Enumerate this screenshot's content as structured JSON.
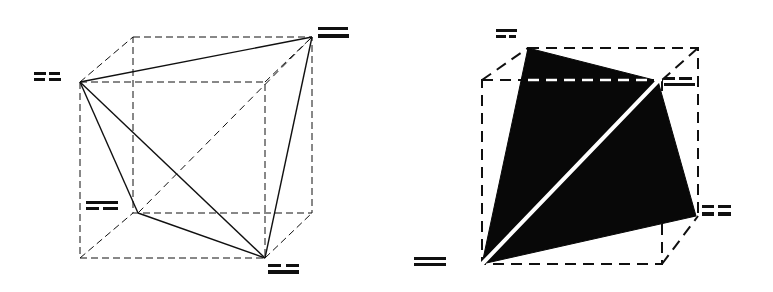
{
  "figure": {
    "canvas": {
      "width": 773,
      "height": 292,
      "background": "#ffffff"
    },
    "ink_color": "#101010",
    "highlight_color": "#ffffff",
    "panels": [
      {
        "id": "left-panel",
        "name": "wireframe-tetrahedron-in-cube",
        "style": "outline",
        "cube": {
          "stroke": "#101010",
          "stroke_width": 1,
          "dash": "7,4",
          "front_face": [
            [
              80,
              82
            ],
            [
              265,
              82
            ],
            [
              265,
              258
            ],
            [
              80,
              258
            ]
          ],
          "back_face": [
            [
              133,
              37
            ],
            [
              312,
              37
            ],
            [
              312,
              213
            ],
            [
              133,
              213
            ]
          ]
        },
        "tetrahedron": {
          "stroke": "#101010",
          "stroke_width": 1.4,
          "fill": "none",
          "vertices": [
            {
              "label_id": "L1",
              "x": 80,
              "y": 82,
              "corner": "front-top-left"
            },
            {
              "label_id": "L2",
              "x": 312,
              "y": 37,
              "corner": "back-top-right"
            },
            {
              "label_id": "L3",
              "x": 138,
              "y": 213,
              "corner": "back-bottom-left"
            },
            {
              "label_id": "L4",
              "x": 265,
              "y": 258,
              "corner": "front-bottom-right"
            }
          ],
          "edges": [
            [
              0,
              1
            ],
            [
              0,
              2
            ],
            [
              0,
              3
            ],
            [
              1,
              3
            ],
            [
              2,
              3
            ],
            [
              1,
              2
            ]
          ],
          "hidden_edges": [
            [
              1,
              2
            ]
          ]
        },
        "labels": [
          {
            "id": "L1",
            "x": 34,
            "y": 72,
            "align": "right",
            "text": ""
          },
          {
            "id": "L2",
            "x": 318,
            "y": 26,
            "align": "left",
            "text": ""
          },
          {
            "id": "L3",
            "x": 86,
            "y": 200,
            "align": "right",
            "text": ""
          },
          {
            "id": "L4",
            "x": 268,
            "y": 262,
            "align": "left",
            "text": ""
          }
        ]
      },
      {
        "id": "right-panel",
        "name": "solid-tetrahedron-in-cube",
        "style": "solid",
        "cube": {
          "stroke": "#101010",
          "stroke_width": 2,
          "dash": "11,7",
          "front_face": [
            [
              482,
              80
            ],
            [
              662,
              80
            ],
            [
              662,
              264
            ],
            [
              482,
              264
            ]
          ],
          "back_face": [
            [
              528,
              48
            ],
            [
              698,
              48
            ],
            [
              698,
              216
            ],
            [
              528,
              216
            ]
          ]
        },
        "tetrahedron": {
          "stroke": "none",
          "fill": "#080808",
          "highlight_stroke": "#ffffff",
          "highlight_width": 4,
          "vertices": [
            {
              "label_id": "R1",
              "x": 528,
              "y": 48,
              "corner": "back-top-left"
            },
            {
              "label_id": "R2",
              "x": 658,
              "y": 81,
              "corner": "front-top-right"
            },
            {
              "label_id": "R3",
              "x": 482,
              "y": 264,
              "corner": "front-bottom-left"
            },
            {
              "label_id": "R4",
              "x": 696,
              "y": 216,
              "corner": "back-bottom-right"
            }
          ],
          "faces": [
            [
              0,
              1,
              2
            ],
            [
              1,
              2,
              3
            ]
          ],
          "highlight_edge": [
            1,
            2
          ]
        },
        "labels": [
          {
            "id": "R1",
            "x": 496,
            "y": 28,
            "align": "left",
            "text": ""
          },
          {
            "id": "R2",
            "x": 664,
            "y": 76,
            "align": "left",
            "text": ""
          },
          {
            "id": "R3",
            "x": 414,
            "y": 256,
            "align": "left",
            "text": ""
          },
          {
            "id": "R4",
            "x": 702,
            "y": 204,
            "align": "left",
            "text": ""
          }
        ]
      }
    ]
  }
}
